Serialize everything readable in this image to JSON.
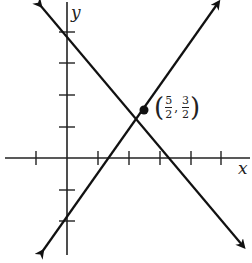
{
  "axes": {
    "x_label": "x",
    "y_label": "y"
  },
  "point": {
    "label": {
      "x_num": "5",
      "x_den": "2",
      "y_num": "3",
      "y_den": "2"
    },
    "x": 2.5,
    "y": 1.5
  },
  "lines": [
    {
      "equation": "y = x - 1",
      "x_intercept": 1,
      "y_intercept": -1
    },
    {
      "equation": "y = -x + 4",
      "x_intercept": 4,
      "y_intercept": 4
    }
  ],
  "ticks": {
    "x": [
      -1,
      1,
      2,
      3,
      4,
      5
    ],
    "y": [
      4,
      3,
      2,
      1,
      -1,
      -2
    ]
  },
  "colors": {
    "ink": "#111111"
  }
}
